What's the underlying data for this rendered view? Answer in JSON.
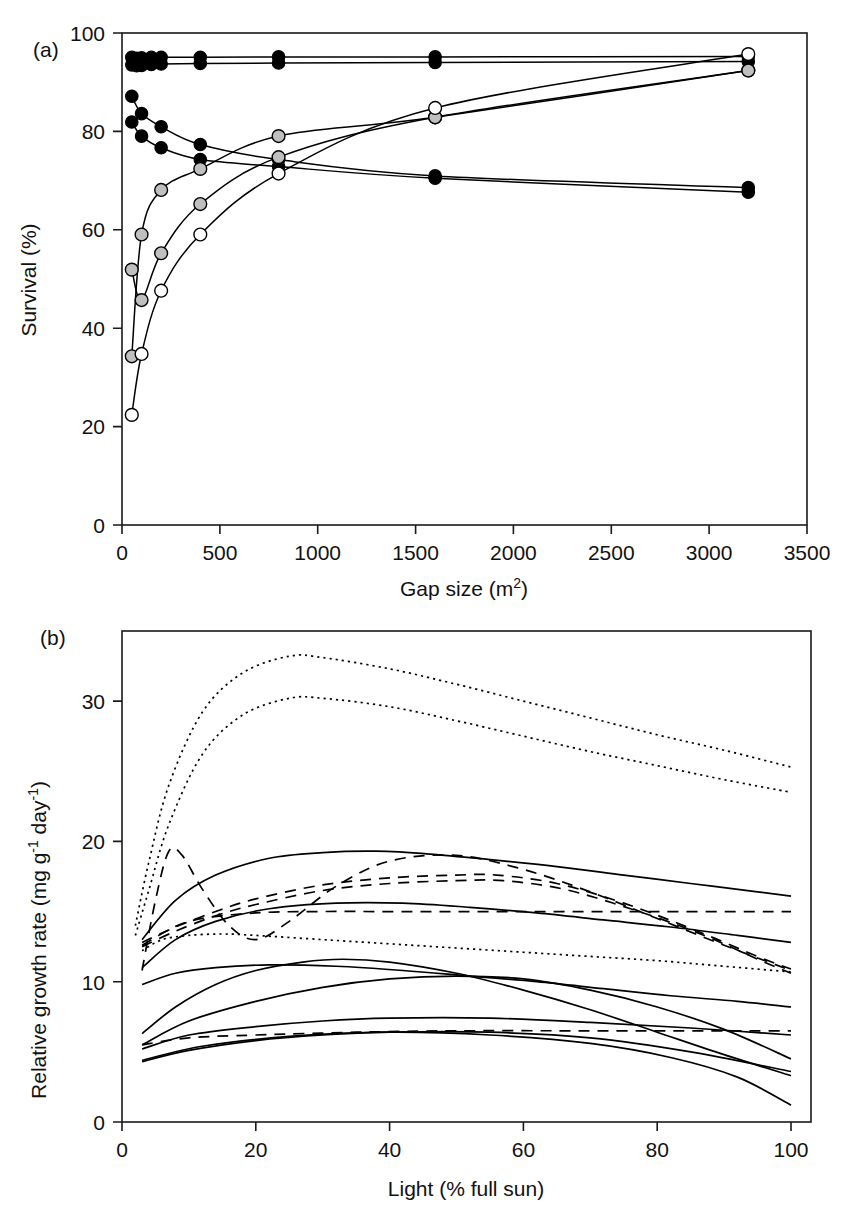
{
  "figure": {
    "panels": [
      {
        "id": "a",
        "label": "(a)",
        "xlabel_main": "Gap size (m",
        "xlabel_sup": "2",
        "xlabel_tail": ")",
        "ylabel": "Survival (%)",
        "x_ticks": [
          "0",
          "500",
          "1000",
          "1500",
          "2000",
          "2500",
          "3000",
          "3500"
        ],
        "y_ticks": [
          "0",
          "20",
          "40",
          "60",
          "80",
          "100"
        ]
      },
      {
        "id": "b",
        "label": "(b)",
        "xlabel": "Light (% full sun)",
        "ylabel_parts": [
          "Relative growth rate (mg g",
          "-1",
          " day",
          "-1",
          ")"
        ],
        "x_ticks": [
          "0",
          "20",
          "40",
          "60",
          "80",
          "100"
        ],
        "y_ticks": [
          "0",
          "10",
          "20",
          "30"
        ]
      }
    ]
  },
  "colors": {
    "ink": "#000000",
    "frame": "#1a1a1a",
    "marker_grey": "#bfbfbf",
    "marker_open": "#ffffff",
    "background": "#ffffff"
  },
  "chart_data": [
    {
      "type": "scatter",
      "panel": "a",
      "title": "",
      "xlabel": "Gap size (m2)",
      "ylabel": "Survival (%)",
      "xlim": [
        0,
        3500
      ],
      "ylim": [
        0,
        105
      ],
      "xticks": [
        0,
        500,
        1000,
        1500,
        2000,
        2500,
        3000,
        3500
      ],
      "yticks": [
        0,
        20,
        40,
        60,
        80,
        100
      ],
      "grid": false,
      "legend": "none",
      "marker_types": [
        "filled-black",
        "grey",
        "open-white"
      ],
      "series": [
        {
          "name": "shade-tolerant A",
          "marker": "filled-black",
          "x": [
            50,
            75,
            100,
            150,
            200,
            400,
            800,
            1600,
            3200
          ],
          "y": [
            99.8,
            99.6,
            99.7,
            99.8,
            99.8,
            99.8,
            99.9,
            99.9,
            100.0
          ]
        },
        {
          "name": "shade-tolerant B",
          "marker": "filled-black",
          "x": [
            50,
            75,
            100,
            150,
            200,
            400,
            800,
            1600,
            3200
          ],
          "y": [
            98.2,
            98.0,
            98.1,
            98.3,
            98.4,
            98.5,
            98.6,
            98.7,
            98.9
          ]
        },
        {
          "name": "declining C",
          "marker": "filled-black",
          "x": [
            50,
            100,
            200,
            400,
            800,
            1600,
            3200
          ],
          "y": [
            91.5,
            87.8,
            85.0,
            81.2,
            78.0,
            74.5,
            72.0
          ]
        },
        {
          "name": "declining D",
          "marker": "filled-black",
          "x": [
            50,
            100,
            200,
            400,
            800,
            1600,
            3200
          ],
          "y": [
            86.0,
            83.0,
            80.5,
            78.0,
            76.5,
            74.0,
            71.0
          ]
        },
        {
          "name": "pioneer grey E",
          "marker": "grey",
          "x": [
            50,
            100,
            200,
            400,
            800,
            1600,
            3200
          ],
          "y": [
            36.0,
            62.0,
            71.5,
            76.0,
            83.0,
            87.0,
            97.0
          ]
        },
        {
          "name": "pioneer grey F",
          "marker": "grey",
          "x": [
            50,
            100,
            200,
            400,
            800,
            1600,
            3200
          ],
          "y": [
            54.5,
            48.0,
            58.0,
            68.5,
            78.5,
            87.0,
            97.0
          ]
        },
        {
          "name": "pioneer open G",
          "marker": "open-white",
          "x": [
            50,
            100,
            200,
            400,
            800,
            1600,
            3200
          ],
          "y": [
            23.5,
            36.5,
            50.0,
            62.0,
            75.0,
            89.0,
            100.5
          ]
        }
      ]
    },
    {
      "type": "line",
      "panel": "b",
      "title": "",
      "xlabel": "Light (% full sun)",
      "ylabel": "Relative growth rate (mg g-1 day-1)",
      "xlim": [
        0,
        103
      ],
      "ylim": [
        0,
        35
      ],
      "xticks": [
        0,
        20,
        40,
        60,
        80,
        100
      ],
      "yticks": [
        0,
        10,
        20,
        30
      ],
      "grid": false,
      "legend": "none",
      "linestyles": [
        "dotted",
        "dashed",
        "solid"
      ],
      "series": [
        {
          "name": "dotted-1",
          "style": "dotted",
          "x": [
            2,
            4,
            7,
            12,
            18,
            25,
            30,
            40,
            50,
            60,
            70,
            80,
            90,
            100
          ],
          "y": [
            14.0,
            18.5,
            24.0,
            29.2,
            32.0,
            33.2,
            33.1,
            32.3,
            31.2,
            30.0,
            28.8,
            27.6,
            26.5,
            25.3
          ]
        },
        {
          "name": "dotted-2",
          "style": "dotted",
          "x": [
            2,
            4,
            7,
            12,
            18,
            25,
            30,
            40,
            50,
            60,
            70,
            80,
            90,
            100
          ],
          "y": [
            13.3,
            16.5,
            21.2,
            26.2,
            29.0,
            30.2,
            30.2,
            29.6,
            28.6,
            27.5,
            26.4,
            25.4,
            24.4,
            23.5
          ]
        },
        {
          "name": "dotted-3-low",
          "style": "dotted",
          "x": [
            3,
            6,
            10,
            15,
            20,
            30,
            40,
            50,
            60,
            70,
            80,
            90,
            100
          ],
          "y": [
            12.2,
            13.0,
            13.3,
            13.4,
            13.3,
            13.0,
            12.7,
            12.4,
            12.1,
            11.8,
            11.5,
            11.1,
            10.7
          ]
        },
        {
          "name": "dashed-hump",
          "style": "dashed",
          "x": [
            3,
            5,
            7,
            9,
            12,
            16,
            20,
            25,
            32,
            40,
            50,
            60,
            70,
            80,
            90,
            100
          ],
          "y": [
            10.8,
            15.8,
            19.3,
            19.0,
            16.6,
            14.0,
            13.0,
            14.3,
            16.8,
            18.6,
            19.0,
            18.0,
            16.4,
            14.5,
            12.6,
            10.8
          ]
        },
        {
          "name": "dashed-rise-1",
          "style": "dashed",
          "x": [
            3,
            8,
            14,
            20,
            30,
            40,
            50,
            56,
            65,
            75,
            85,
            95,
            100
          ],
          "y": [
            12.8,
            13.9,
            15.0,
            15.9,
            16.9,
            17.4,
            17.6,
            17.6,
            17.0,
            15.6,
            13.8,
            11.8,
            10.9
          ]
        },
        {
          "name": "dashed-rise-2",
          "style": "dashed",
          "x": [
            3,
            8,
            14,
            20,
            30,
            40,
            50,
            57,
            66,
            76,
            86,
            96,
            100
          ],
          "y": [
            12.5,
            13.6,
            14.7,
            15.5,
            16.5,
            17.0,
            17.2,
            17.2,
            16.6,
            15.2,
            13.5,
            11.4,
            10.6
          ]
        },
        {
          "name": "dashed-flat-15",
          "style": "dashed",
          "x": [
            3,
            10,
            20,
            30,
            40,
            60,
            80,
            100
          ],
          "y": [
            12.6,
            14.3,
            14.9,
            15.0,
            15.0,
            15.0,
            15.0,
            15.0
          ]
        },
        {
          "name": "dashed-flat-6",
          "style": "dashed",
          "x": [
            3,
            10,
            20,
            35,
            50,
            70,
            85,
            100
          ],
          "y": [
            5.5,
            6.0,
            6.2,
            6.4,
            6.5,
            6.5,
            6.5,
            6.5
          ]
        },
        {
          "name": "solid-top",
          "style": "solid",
          "x": [
            3,
            8,
            14,
            22,
            30,
            38,
            46,
            55,
            65,
            75,
            85,
            95,
            100
          ],
          "y": [
            13.0,
            15.8,
            17.6,
            18.8,
            19.2,
            19.3,
            19.1,
            18.7,
            18.2,
            17.6,
            17.0,
            16.4,
            16.1
          ]
        },
        {
          "name": "solid-second",
          "style": "solid",
          "x": [
            3,
            8,
            14,
            22,
            32,
            42,
            52,
            62,
            72,
            82,
            92,
            100
          ],
          "y": [
            11.0,
            13.0,
            14.3,
            15.2,
            15.6,
            15.6,
            15.3,
            14.9,
            14.4,
            13.9,
            13.3,
            12.8
          ]
        },
        {
          "name": "solid-third",
          "style": "solid",
          "x": [
            3,
            8,
            14,
            22,
            32,
            42,
            52,
            62,
            72,
            82,
            92,
            100
          ],
          "y": [
            9.8,
            10.6,
            11.0,
            11.2,
            11.1,
            10.8,
            10.4,
            10.0,
            9.5,
            9.0,
            8.6,
            8.2
          ]
        },
        {
          "name": "solid-hump-mid",
          "style": "solid",
          "x": [
            3,
            8,
            14,
            20,
            27,
            33,
            40,
            50,
            60,
            70,
            80,
            90,
            100
          ],
          "y": [
            6.3,
            8.2,
            9.8,
            10.8,
            11.4,
            11.6,
            11.4,
            10.6,
            9.4,
            8.0,
            6.4,
            4.8,
            3.3
          ]
        },
        {
          "name": "solid-rise-cross",
          "style": "solid",
          "x": [
            3,
            10,
            20,
            30,
            40,
            50,
            60,
            70,
            80,
            90,
            100
          ],
          "y": [
            5.5,
            7.2,
            8.6,
            9.6,
            10.2,
            10.4,
            10.2,
            9.4,
            8.2,
            6.6,
            4.5
          ]
        },
        {
          "name": "solid-low-flat",
          "style": "solid",
          "x": [
            3,
            10,
            20,
            30,
            40,
            55,
            70,
            85,
            100
          ],
          "y": [
            5.2,
            6.2,
            6.8,
            7.2,
            7.4,
            7.4,
            7.1,
            6.7,
            6.2
          ]
        },
        {
          "name": "solid-lowest",
          "style": "solid",
          "x": [
            3,
            10,
            20,
            30,
            40,
            55,
            70,
            85,
            100
          ],
          "y": [
            4.3,
            5.1,
            5.8,
            6.2,
            6.4,
            6.4,
            6.0,
            5.0,
            3.6
          ]
        },
        {
          "name": "solid-bottom-decline",
          "style": "solid",
          "x": [
            3,
            12,
            25,
            40,
            55,
            70,
            82,
            92,
            100
          ],
          "y": [
            4.4,
            5.4,
            6.1,
            6.4,
            6.2,
            5.6,
            4.6,
            3.2,
            1.2
          ]
        }
      ]
    }
  ]
}
